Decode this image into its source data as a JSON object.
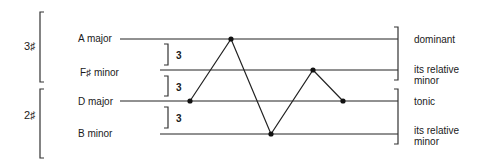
{
  "key_signatures": [
    {
      "label": "3♯",
      "y": 48
    },
    {
      "label": "2♯",
      "y": 116
    }
  ],
  "keys": [
    {
      "name": "A major",
      "y": 39,
      "line_start": 120
    },
    {
      "name": "F♯  minor",
      "y": 70,
      "line_start": 160
    },
    {
      "name": "D major",
      "y": 101,
      "line_start": 120
    },
    {
      "name": "B minor",
      "y": 134,
      "line_start": 160
    }
  ],
  "intervals": [
    {
      "label": "3",
      "y_top": 44,
      "y_bottom": 65
    },
    {
      "label": "3",
      "y_top": 76,
      "y_bottom": 96
    },
    {
      "label": "3",
      "y_top": 107,
      "y_bottom": 128
    }
  ],
  "roles": [
    {
      "text": "dominant"
    },
    {
      "text_line1": "its relative",
      "text_line2": "minor"
    },
    {
      "text": "tonic"
    },
    {
      "text_line1": "its relative",
      "text_line2": "minor"
    }
  ],
  "path_points": [
    {
      "x": 190,
      "y": 101
    },
    {
      "x": 231,
      "y": 39
    },
    {
      "x": 271,
      "y": 134
    },
    {
      "x": 313,
      "y": 70
    },
    {
      "x": 343,
      "y": 101
    }
  ],
  "line_color": "#222222"
}
